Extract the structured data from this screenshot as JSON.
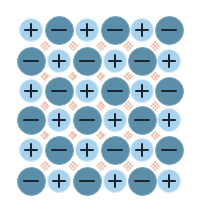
{
  "diagram": {
    "type": "ionic-crystal-lattice",
    "rows": 6,
    "cols": 6,
    "colors": {
      "cation_fill": "#a8d3ef",
      "anion_fill": "#5b8ea9",
      "sign": "#1b2630",
      "bond": "#f0a58a",
      "background": "#ffffff"
    },
    "col_centers": [
      31,
      59,
      87,
      115,
      142,
      169
    ],
    "row_centers": [
      30,
      61,
      91,
      120,
      150,
      181
    ],
    "grid": [
      [
        "+",
        "-",
        "+",
        "-",
        "+",
        "-"
      ],
      [
        "-",
        "+",
        "-",
        "+",
        "-",
        "+"
      ],
      [
        "+",
        "-",
        "+",
        "-",
        "+",
        "-"
      ],
      [
        "-",
        "+",
        "-",
        "+",
        "-",
        "+"
      ],
      [
        "+",
        "-",
        "+",
        "-",
        "+",
        "-"
      ],
      [
        "-",
        "+",
        "-",
        "+",
        "-",
        "+"
      ]
    ],
    "legend": {
      "positive": "positive ion (+)",
      "negative": "negative ion (−)"
    }
  }
}
